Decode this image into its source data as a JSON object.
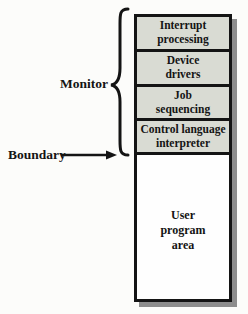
{
  "figure": {
    "monitor_label": "Monitor",
    "boundary_label": "Boundary",
    "monitor": {
      "rows": [
        {
          "name": "interrupt-processing",
          "lines": [
            "Interrupt",
            "processing"
          ]
        },
        {
          "name": "device-drivers",
          "lines": [
            "Device",
            "drivers"
          ]
        },
        {
          "name": "job-sequencing",
          "lines": [
            "Job",
            "sequencing"
          ]
        },
        {
          "name": "control-language-interpreter",
          "lines": [
            "Control language",
            "interpreter"
          ]
        }
      ]
    },
    "user_area": {
      "lines": [
        "User",
        "program",
        "area"
      ]
    },
    "icons": [
      "monitor-brace-icon",
      "boundary-arrow-icon"
    ],
    "colors": {
      "row_fill": "#d9dbd3",
      "user_fill": "#fefefe",
      "line": "#141414",
      "shadow": "#8d8d8d",
      "background": "#fcfcfa",
      "text": "#141414"
    }
  }
}
